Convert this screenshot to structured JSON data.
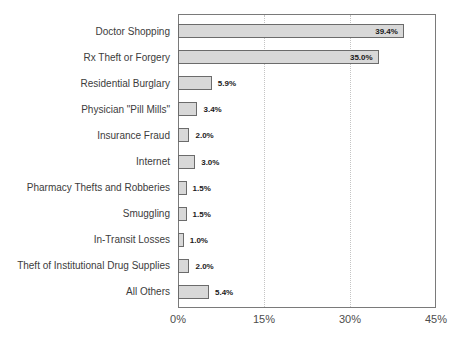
{
  "chart_data": {
    "type": "bar",
    "orientation": "horizontal",
    "title": "",
    "xlabel": "",
    "ylabel": "",
    "categories": [
      "Doctor Shopping",
      "Rx Theft or Forgery",
      "Residential Burglary",
      "Physician \"Pill Mills\"",
      "Insurance Fraud",
      "Internet",
      "Pharmacy Thefts and Robberies",
      "Smuggling",
      "In-Transit Losses",
      "Theft of Institutional Drug Supplies",
      "All Others"
    ],
    "values": [
      39.4,
      35.0,
      5.9,
      3.4,
      2.0,
      3.0,
      1.5,
      1.5,
      1.0,
      2.0,
      5.4
    ],
    "value_labels": [
      "39.4%",
      "35.0%",
      "5.9%",
      "3.4%",
      "2.0%",
      "3.0%",
      "1.5%",
      "1.5%",
      "1.0%",
      "2.0%",
      "5.4%"
    ],
    "xlim": [
      0,
      45
    ],
    "xticks": [
      0,
      15,
      30,
      45
    ],
    "xtick_labels": [
      "0%",
      "15%",
      "30%",
      "45%"
    ],
    "gridlines_at": [
      15,
      30
    ],
    "grid_style": "dotted-vertical",
    "legend": "none",
    "inside_label_threshold": 20,
    "colors": {
      "bar_fill": "#d8d8d8",
      "bar_border": "#6b6b6b",
      "plot_border": "#7a7a7a",
      "gridline": "#c4c4c4",
      "category_text": "#3c3c3c",
      "axis_text": "#4d4d4d",
      "value_text": "#1a1a1a",
      "background": "#ffffff"
    }
  }
}
